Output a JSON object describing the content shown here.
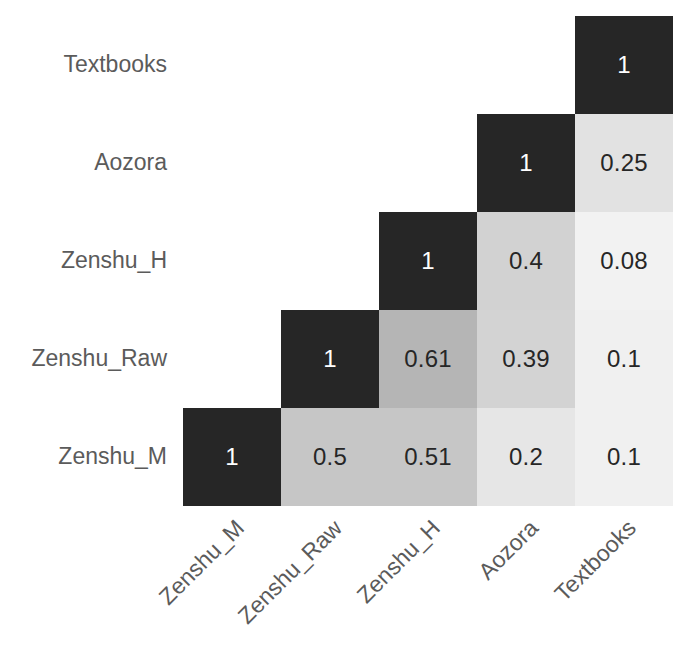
{
  "chart_data": {
    "type": "heatmap",
    "title": "",
    "subtitle": "",
    "xlabel": "",
    "ylabel": "",
    "legend": "none",
    "grid": false,
    "shape": "lower-triangle",
    "value_range": [
      0,
      1
    ],
    "colormap": "grayscale-inverted (1 = near-black, 0 = near-white)",
    "categories": [
      "Zenshu_M",
      "Zenshu_Raw",
      "Zenshu_H",
      "Aozora",
      "Textbooks"
    ],
    "x_tick_labels": [
      "Zenshu_M",
      "Zenshu_Raw",
      "Zenshu_H",
      "Aozora",
      "Textbooks"
    ],
    "y_tick_labels_bottom_to_top": [
      "Zenshu_M",
      "Zenshu_Raw",
      "Zenshu_H",
      "Aozora",
      "Textbooks"
    ],
    "y_tick_labels_top_to_bottom": [
      "Textbooks",
      "Aozora",
      "Zenshu_H",
      "Zenshu_Raw",
      "Zenshu_M"
    ],
    "x_tick_rotation_deg": 45,
    "matrix_rows_top_to_bottom": [
      {
        "row": "Textbooks",
        "values": [
          null,
          null,
          null,
          null,
          1
        ]
      },
      {
        "row": "Aozora",
        "values": [
          null,
          null,
          null,
          1,
          0.25
        ]
      },
      {
        "row": "Zenshu_H",
        "values": [
          null,
          null,
          1,
          0.4,
          0.08
        ]
      },
      {
        "row": "Zenshu_Raw",
        "values": [
          null,
          1,
          0.61,
          0.39,
          0.1
        ]
      },
      {
        "row": "Zenshu_M",
        "values": [
          1,
          0.5,
          0.51,
          0.2,
          0.1
        ]
      }
    ],
    "cells": [
      {
        "row": "Textbooks",
        "col": "Textbooks",
        "value": 1,
        "label": "1",
        "fill": "#262626",
        "text_color": "#ffffff",
        "r": 0,
        "c": 4
      },
      {
        "row": "Aozora",
        "col": "Aozora",
        "value": 1,
        "label": "1",
        "fill": "#262626",
        "text_color": "#ffffff",
        "r": 1,
        "c": 3
      },
      {
        "row": "Aozora",
        "col": "Textbooks",
        "value": 0.25,
        "label": "0.25",
        "fill": "#e2e2e2",
        "text_color": "#262626",
        "r": 1,
        "c": 4
      },
      {
        "row": "Zenshu_H",
        "col": "Zenshu_H",
        "value": 1,
        "label": "1",
        "fill": "#262626",
        "text_color": "#ffffff",
        "r": 2,
        "c": 2
      },
      {
        "row": "Zenshu_H",
        "col": "Aozora",
        "value": 0.4,
        "label": "0.4",
        "fill": "#d2d2d2",
        "text_color": "#262626",
        "r": 2,
        "c": 3
      },
      {
        "row": "Zenshu_H",
        "col": "Textbooks",
        "value": 0.08,
        "label": "0.08",
        "fill": "#f2f2f2",
        "text_color": "#262626",
        "r": 2,
        "c": 4
      },
      {
        "row": "Zenshu_Raw",
        "col": "Zenshu_Raw",
        "value": 1,
        "label": "1",
        "fill": "#262626",
        "text_color": "#ffffff",
        "r": 3,
        "c": 1
      },
      {
        "row": "Zenshu_Raw",
        "col": "Zenshu_H",
        "value": 0.61,
        "label": "0.61",
        "fill": "#b5b5b5",
        "text_color": "#262626",
        "r": 3,
        "c": 2
      },
      {
        "row": "Zenshu_Raw",
        "col": "Aozora",
        "value": 0.39,
        "label": "0.39",
        "fill": "#d3d3d3",
        "text_color": "#262626",
        "r": 3,
        "c": 3
      },
      {
        "row": "Zenshu_Raw",
        "col": "Textbooks",
        "value": 0.1,
        "label": "0.1",
        "fill": "#f0f0f0",
        "text_color": "#262626",
        "r": 3,
        "c": 4
      },
      {
        "row": "Zenshu_M",
        "col": "Zenshu_M",
        "value": 1,
        "label": "1",
        "fill": "#262626",
        "text_color": "#ffffff",
        "r": 4,
        "c": 0
      },
      {
        "row": "Zenshu_M",
        "col": "Zenshu_Raw",
        "value": 0.5,
        "label": "0.5",
        "fill": "#c6c6c6",
        "text_color": "#262626",
        "r": 4,
        "c": 1
      },
      {
        "row": "Zenshu_M",
        "col": "Zenshu_H",
        "value": 0.51,
        "label": "0.51",
        "fill": "#c6c6c6",
        "text_color": "#262626",
        "r": 4,
        "c": 2
      },
      {
        "row": "Zenshu_M",
        "col": "Aozora",
        "value": 0.2,
        "label": "0.2",
        "fill": "#e6e6e6",
        "text_color": "#262626",
        "r": 4,
        "c": 3
      },
      {
        "row": "Zenshu_M",
        "col": "Textbooks",
        "value": 0.1,
        "label": "0.1",
        "fill": "#f0f0f0",
        "text_color": "#262626",
        "r": 4,
        "c": 4
      }
    ]
  },
  "style": {
    "background": "#ffffff",
    "tick_label_color": "#5b5b5b",
    "diagonal_fill": "#262626",
    "diagonal_text_color": "#ffffff",
    "offdiagonal_text_color": "#262626"
  }
}
